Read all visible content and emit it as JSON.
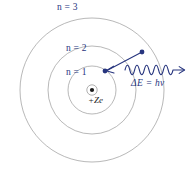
{
  "diagram": {
    "canvas": {
      "width": 196,
      "height": 169,
      "background": "#ffffff"
    },
    "colors": {
      "orbit_stroke": "#9a9a9a",
      "annotation": "#27357e",
      "nucleus": "#1b1b1b"
    },
    "nucleus": {
      "label": "+Ze",
      "center": {
        "x": 92,
        "y": 90
      },
      "core_radius": 2.1,
      "ring_radius": 5.2
    },
    "shells": [
      {
        "name": "shell-n1",
        "label": "n = 1",
        "quantum_number": 1,
        "radius": 24
      },
      {
        "name": "shell-n2",
        "label": "n = 2",
        "quantum_number": 2,
        "radius": 44
      },
      {
        "name": "shell-n3",
        "label": "n = 3",
        "quantum_number": 3,
        "radius": 72
      }
    ],
    "electrons": [
      {
        "name": "electron-on-n2",
        "shell": 2,
        "x": 142,
        "y": 52,
        "radius": 2.3
      },
      {
        "name": "electron-on-n1",
        "shell": 1,
        "x": 105,
        "y": 71,
        "radius": 2.3
      }
    ],
    "transition": {
      "from": {
        "x": 142,
        "y": 52
      },
      "to": {
        "x": 106.5,
        "y": 70.5
      },
      "description": "electron drops from n = 2 to n = 1"
    },
    "photon": {
      "label": "ΔE = hν",
      "start": {
        "x": 125,
        "y": 70
      },
      "end": {
        "x": 184,
        "y": 70
      },
      "wavelength": 9.6,
      "amplitude": 5.2,
      "cycles": 6
    }
  }
}
